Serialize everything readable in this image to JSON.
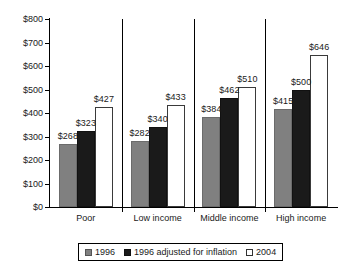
{
  "chart_data": {
    "type": "bar",
    "title": "",
    "xlabel": "",
    "ylabel": "",
    "categories": [
      "Poor",
      "Low income",
      "Middle income",
      "High income"
    ],
    "series": [
      {
        "name": "1996",
        "color": "#808080",
        "values": [
          268,
          323,
          384,
          415
        ]
      },
      {
        "name": "1996 adjusted for inflation",
        "color": "#1a1a1a",
        "values": [
          323,
          340,
          462,
          500
        ]
      },
      {
        "name": "2004",
        "color": "#ffffff",
        "values": [
          427,
          433,
          510,
          646
        ]
      }
    ],
    "series_values": [
      {
        "name": "1996",
        "color": "#808080",
        "values": [
          268,
          282,
          384,
          415
        ]
      },
      {
        "name": "1996 adjusted for inflation",
        "color": "#1a1a1a",
        "values": [
          323,
          340,
          462,
          500
        ]
      },
      {
        "name": "2004",
        "color": "#ffffff",
        "values": [
          427,
          433,
          510,
          646
        ]
      }
    ],
    "data_labels": [
      [
        "$268",
        "$282",
        "$384",
        "$415"
      ],
      [
        "$323",
        "$340",
        "$462",
        "$500"
      ],
      [
        "$427",
        "$433",
        "$510",
        "$646"
      ]
    ],
    "ylim": [
      0,
      800
    ],
    "ytick_values": [
      0,
      100,
      200,
      300,
      400,
      500,
      600,
      700,
      800
    ],
    "ytick_labels": [
      "$0",
      "$100",
      "$200",
      "$300",
      "$400",
      "$500",
      "$600",
      "$700",
      "$800"
    ],
    "grid": false,
    "legend_position": "bottom"
  },
  "legend": {
    "items": [
      {
        "label": "1996"
      },
      {
        "label": "1996 adjusted for inflation"
      },
      {
        "label": "2004"
      }
    ]
  }
}
